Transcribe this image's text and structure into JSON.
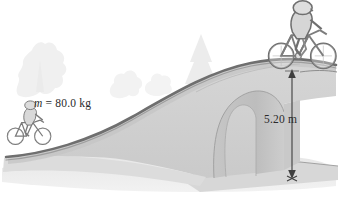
{
  "figure": {
    "kind": "physics-diagram",
    "background_color": "#ffffff"
  },
  "labels": {
    "mass_symbol": "m",
    "mass_equals": " =  80.0 kg",
    "mass_full": "m =  80.0 kg",
    "height": "5.20 m"
  },
  "annotations": {
    "dimension_arrow": {
      "name": "height-dimension-arrow",
      "top_label": "5.20 m",
      "orientation": "vertical",
      "double_headed": true
    }
  },
  "colors": {
    "deck_line": "#6f6f6f",
    "bridge_body": "#d2d2d2",
    "bridge_body_dark": "#c2c2c2",
    "arch_shadow": "#bdbdbd",
    "ground": "#cfcfcf",
    "water": "#e2e2e2",
    "tree": "#ededed",
    "outline": "#8a8a8a",
    "arrow": "#4a4a4a",
    "text": "#2b2b2b",
    "cyclist_fill": "#d8d8d8",
    "cyclist_line": "#6a6a6a"
  },
  "elements": {
    "cyclist_left": "cyclist-left",
    "cyclist_right": "cyclist-right",
    "bridge": "arched-bridge",
    "arch_opening": "bridge-arch-opening",
    "ground_line": "ground-line",
    "trees": "background-trees"
  }
}
